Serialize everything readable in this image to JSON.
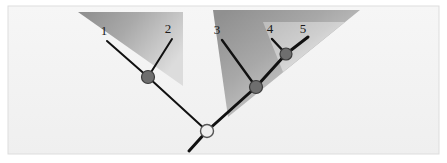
{
  "figure": {
    "type": "phylogenetic-tree-diagram",
    "canvas": {
      "width": 447,
      "height": 163
    },
    "background_color": "#ffffff",
    "panel_color": "#f2f2f2",
    "border_color": "#d8d8d8",
    "branch_color": "#111111",
    "internal_node_fill": "#6e6e6e",
    "internal_node_stroke": "#3c3c3c",
    "root_node_fill": "#efefef",
    "root_node_stroke": "#555555",
    "wedge_light": "#e9e9e9",
    "wedge_dark": "#8f8f8f",
    "wedge_mid": "#b4b4b4"
  },
  "tips": [
    {
      "id": "tip-1",
      "label": "1",
      "label_x": 104,
      "label_y": 35,
      "x": 107,
      "y": 41,
      "tip_x": 107,
      "tip_y": 41
    },
    {
      "id": "tip-2",
      "label": "2",
      "label_x": 168,
      "label_y": 33,
      "x": 172,
      "y": 39,
      "tip_x": 172,
      "tip_y": 39
    },
    {
      "id": "tip-3",
      "label": "3",
      "label_x": 217,
      "label_y": 34,
      "x": 222,
      "y": 40,
      "tip_x": 222,
      "tip_y": 40
    },
    {
      "id": "tip-4",
      "label": "4",
      "label_x": 270,
      "label_y": 33,
      "x": 272,
      "y": 39,
      "tip_x": 272,
      "tip_y": 39
    },
    {
      "id": "tip-5",
      "label": "5",
      "label_x": 303,
      "label_y": 33,
      "x": 308,
      "y": 37,
      "tip_x": 308,
      "tip_y": 37
    }
  ],
  "internal_nodes": [
    {
      "id": "node-a",
      "x": 148,
      "y": 77,
      "r": 6.5,
      "kind": "internal",
      "children": [
        "tip-1",
        "tip-2"
      ]
    },
    {
      "id": "node-b",
      "x": 256,
      "y": 87,
      "r": 6.5,
      "kind": "internal",
      "children": [
        "tip-3",
        "node-c"
      ]
    },
    {
      "id": "node-c",
      "x": 286,
      "y": 54,
      "r": 6.0,
      "kind": "internal",
      "children": [
        "tip-4",
        "tip-5"
      ]
    },
    {
      "id": "node-root",
      "x": 207,
      "y": 131,
      "r": 6.5,
      "kind": "root",
      "children": [
        "node-a",
        "node-b"
      ]
    }
  ],
  "branches": [
    {
      "id": "branch-tip-1",
      "from": "tip-1",
      "to": "node-a",
      "x1": 107,
      "y1": 41,
      "x2": 148,
      "y2": 77,
      "width": 2.0
    },
    {
      "id": "branch-tip-2",
      "from": "tip-2",
      "to": "node-a",
      "x1": 172,
      "y1": 39,
      "x2": 148,
      "y2": 77,
      "width": 2.0
    },
    {
      "id": "branch-node-a",
      "from": "node-a",
      "to": "node-root",
      "x1": 148,
      "y1": 77,
      "x2": 207,
      "y2": 131,
      "width": 2.0
    },
    {
      "id": "branch-tip-3",
      "from": "tip-3",
      "to": "node-b",
      "x1": 222,
      "y1": 40,
      "x2": 256,
      "y2": 87,
      "width": 2.4
    },
    {
      "id": "branch-tip-4",
      "from": "tip-4",
      "to": "node-c",
      "x1": 272,
      "y1": 39,
      "x2": 286,
      "y2": 54,
      "width": 2.4
    },
    {
      "id": "branch-tip-5",
      "from": "tip-5",
      "to": "node-c",
      "x1": 308,
      "y1": 37,
      "x2": 286,
      "y2": 54,
      "width": 3.0
    },
    {
      "id": "branch-node-c",
      "from": "node-c",
      "to": "node-b",
      "x1": 286,
      "y1": 54,
      "x2": 256,
      "y2": 87,
      "width": 3.0
    },
    {
      "id": "branch-node-b",
      "from": "node-b",
      "to": "node-root",
      "x1": 256,
      "y1": 87,
      "x2": 207,
      "y2": 131,
      "width": 3.0
    },
    {
      "id": "branch-root-stem",
      "from": "node-root",
      "to": "stem-end",
      "x1": 207,
      "y1": 131,
      "x2": 189,
      "y2": 151,
      "width": 3.0
    }
  ],
  "wedges": [
    {
      "id": "wedge-left-clade",
      "name": "left-clade-wedge",
      "points": "78,12 183,12 183,86",
      "opacity": 0.95,
      "gradient": "grad-left"
    },
    {
      "id": "wedge-right-outer-clade",
      "name": "right-outer-clade-wedge",
      "points": "213,10 360,10 228,117",
      "opacity": 0.95,
      "gradient": "grad-right-outer"
    },
    {
      "id": "wedge-right-inner-clade",
      "name": "right-inner-clade-wedge",
      "points": "263,22 345,22 283,72",
      "opacity": 0.95,
      "gradient": "grad-right-inner"
    }
  ],
  "panel": {
    "x": 8,
    "y": 6,
    "width": 431,
    "height": 148
  }
}
